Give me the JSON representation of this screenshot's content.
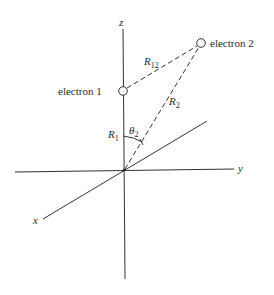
{
  "diagram": {
    "type": "coordinate-geometry",
    "axes": {
      "z_label": "z",
      "y_label": "y",
      "x_label": "x"
    },
    "particles": [
      {
        "label": "electron 1"
      },
      {
        "label": "electron 2"
      }
    ],
    "distances": {
      "r12_main": "R",
      "r12_sub": "12",
      "r2_main": "R",
      "r2_sub": "2",
      "r1_main": "R",
      "r1_sub": "1"
    },
    "angle": {
      "main": "θ",
      "sub": "2"
    },
    "colors": {
      "line": "#333333",
      "text": "#2a2a2a",
      "background": "#ffffff"
    }
  }
}
